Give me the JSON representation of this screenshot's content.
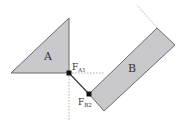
{
  "diagram": {
    "bodies": [
      {
        "id": "A",
        "label": "A",
        "shape": "triangle"
      },
      {
        "id": "B",
        "label": "B",
        "shape": "rectangle"
      }
    ],
    "forces": [
      {
        "id": "FA1",
        "main": "F",
        "sub": "A1"
      },
      {
        "id": "FB2",
        "main": "F",
        "sub": "B2"
      }
    ],
    "colors": {
      "fill": "#c9c9cd",
      "stroke": "#6a6a6a",
      "dashed": "#9a9a9a",
      "link": "#333333",
      "dot": "#111111"
    }
  }
}
